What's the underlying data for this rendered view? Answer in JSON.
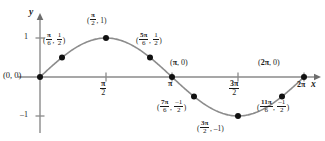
{
  "chart_data": {
    "type": "line",
    "title": "",
    "xlabel": "x",
    "ylabel": "y",
    "function": "y = sin x",
    "xlim": [
      0,
      6.283185
    ],
    "ylim": [
      -1.35,
      1.35
    ],
    "grid": false,
    "legend": null,
    "x_ticks": [
      {
        "value": 1.570796,
        "label_num": "π",
        "label_den": "2"
      },
      {
        "value": 3.141593,
        "label_num": "π",
        "label_den": ""
      },
      {
        "value": 4.712389,
        "label_num": "3π",
        "label_den": "2"
      },
      {
        "value": 6.283185,
        "label_num": "2π",
        "label_den": ""
      }
    ],
    "y_ticks": [
      {
        "value": 1,
        "label": "1"
      },
      {
        "value": -1,
        "label": "–1"
      }
    ],
    "series": [
      {
        "name": "y = sin x",
        "color": "#7a7a7a",
        "x": [
          0,
          0.523599,
          1.570796,
          2.617994,
          3.141593,
          3.665191,
          4.712389,
          5.759587,
          6.283185
        ],
        "values": [
          0,
          0.5,
          1,
          0.5,
          0,
          -0.5,
          -1,
          -0.5,
          0
        ]
      }
    ],
    "points": [
      {
        "x": 0,
        "y": 0,
        "xs": "0",
        "ys": "0"
      },
      {
        "x": 0.523599,
        "y": 0.5,
        "xs": "π/6",
        "ys": "1/2"
      },
      {
        "x": 1.570796,
        "y": 1,
        "xs": "π/2",
        "ys": "1"
      },
      {
        "x": 2.617994,
        "y": 0.5,
        "xs": "5π/6",
        "ys": "1/2"
      },
      {
        "x": 3.141593,
        "y": 0,
        "xs": "π",
        "ys": "0"
      },
      {
        "x": 3.665191,
        "y": -0.5,
        "xs": "7π/6",
        "ys": "–1/2"
      },
      {
        "x": 4.712389,
        "y": -1,
        "xs": "3π/2",
        "ys": "–1"
      },
      {
        "x": 5.759587,
        "y": -0.5,
        "xs": "11π/6",
        "ys": "–1/2"
      },
      {
        "x": 6.283185,
        "y": 0,
        "xs": "2π",
        "ys": "0"
      }
    ]
  },
  "axis": {
    "y_name": "y",
    "x_name": "x"
  },
  "labels": {
    "origin": "(0, 0)",
    "pi_zero_open": "(",
    "pi_zero_pi": "π",
    "pi_zero_rest": ", 0)",
    "two_pi_zero_open": "(",
    "two_pi_zero_pi": "2π",
    "two_pi_zero_rest": ", 0)",
    "open_paren": "(",
    "comma": ", ",
    "close_paren": ")",
    "half": "1",
    "half_den": "2",
    "neg_half": "–1",
    "one": "1",
    "neg_one": "–1",
    "pi": "π",
    "num_pi_6": "π",
    "den_6": "6",
    "num_5pi": "5π",
    "num_7pi": "7π",
    "num_11pi": "11π",
    "num_pi_2": "π",
    "den_2": "2",
    "num_3pi": "3π",
    "tick_pi": "π",
    "tick_2pi": "2π",
    "y_tick_1": "1",
    "y_tick_neg1": "–1"
  },
  "colors": {
    "curve": "#7a7a7a",
    "axis": "#8a8a8a",
    "point": "#111111",
    "text": "#1a1a1a",
    "background": "#ffffff"
  }
}
